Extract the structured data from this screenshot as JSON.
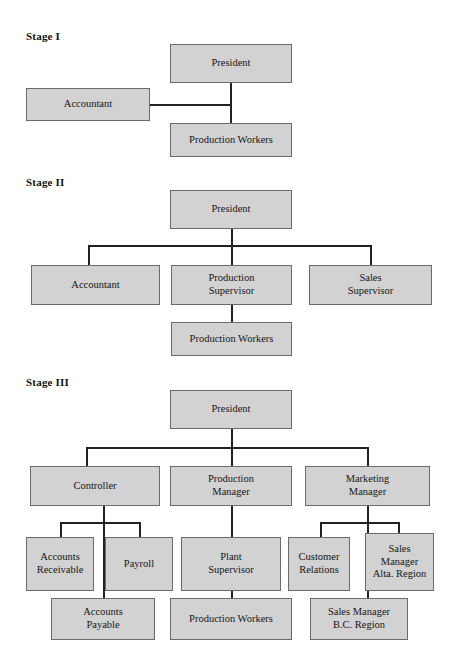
{
  "diagram": {
    "type": "organization-chart",
    "box_fill_color": "#d2d2d2",
    "box_border_color": "#6b6b6b",
    "connector_color": "#222222",
    "background_color": "#ffffff"
  },
  "stages": [
    {
      "id": "stage-1",
      "label": "Stage I",
      "nodes": [
        {
          "id": "s1-president",
          "label": "President",
          "level": 0
        },
        {
          "id": "s1-accountant",
          "label": "Accountant",
          "level": 1
        },
        {
          "id": "s1-production-workers",
          "label": "Production Workers",
          "level": 2
        }
      ],
      "edges": [
        {
          "from": "s1-president",
          "to": "s1-production-workers"
        },
        {
          "from": "s1-president",
          "to": "s1-accountant"
        }
      ]
    },
    {
      "id": "stage-2",
      "label": "Stage II",
      "nodes": [
        {
          "id": "s2-president",
          "label": "President",
          "level": 0
        },
        {
          "id": "s2-accountant",
          "label": "Accountant",
          "level": 1
        },
        {
          "id": "s2-production-supervisor",
          "label": "Production\nSupervisor",
          "line1": "Production",
          "line2": "Supervisor",
          "level": 1
        },
        {
          "id": "s2-sales-supervisor",
          "label": "Sales\nSupervisor",
          "line1": "Sales",
          "line2": "Supervisor",
          "level": 1
        },
        {
          "id": "s2-production-workers",
          "label": "Production Workers",
          "level": 2
        }
      ],
      "edges": [
        {
          "from": "s2-president",
          "to": "s2-accountant"
        },
        {
          "from": "s2-president",
          "to": "s2-production-supervisor"
        },
        {
          "from": "s2-president",
          "to": "s2-sales-supervisor"
        },
        {
          "from": "s2-production-supervisor",
          "to": "s2-production-workers"
        }
      ]
    },
    {
      "id": "stage-3",
      "label": "Stage III",
      "nodes": [
        {
          "id": "s3-president",
          "label": "President",
          "level": 0
        },
        {
          "id": "s3-controller",
          "label": "Controller",
          "level": 1
        },
        {
          "id": "s3-production-manager",
          "line1": "Production",
          "line2": "Manager",
          "level": 1
        },
        {
          "id": "s3-marketing-manager",
          "line1": "Marketing",
          "line2": "Manager",
          "level": 1
        },
        {
          "id": "s3-accounts-receivable",
          "line1": "Accounts",
          "line2": "Receivable",
          "level": 2
        },
        {
          "id": "s3-payroll",
          "label": "Payroll",
          "level": 2
        },
        {
          "id": "s3-plant-supervisor",
          "line1": "Plant",
          "line2": "Supervisor",
          "level": 2
        },
        {
          "id": "s3-customer-relations",
          "line1": "Customer",
          "line2": "Relations",
          "level": 2
        },
        {
          "id": "s3-sales-manager-alta",
          "line1": "Sales",
          "line2": "Manager",
          "line3": "Alta. Region",
          "level": 2
        },
        {
          "id": "s3-accounts-payable",
          "line1": "Accounts",
          "line2": "Payable",
          "level": 3
        },
        {
          "id": "s3-production-workers",
          "label": "Production Workers",
          "level": 3
        },
        {
          "id": "s3-sales-manager-bc",
          "line1": "Sales Manager",
          "line2": "B.C. Region",
          "level": 3
        }
      ],
      "edges": [
        {
          "from": "s3-president",
          "to": "s3-controller"
        },
        {
          "from": "s3-president",
          "to": "s3-production-manager"
        },
        {
          "from": "s3-president",
          "to": "s3-marketing-manager"
        },
        {
          "from": "s3-controller",
          "to": "s3-accounts-receivable"
        },
        {
          "from": "s3-controller",
          "to": "s3-payroll"
        },
        {
          "from": "s3-controller",
          "to": "s3-accounts-payable"
        },
        {
          "from": "s3-production-manager",
          "to": "s3-plant-supervisor"
        },
        {
          "from": "s3-plant-supervisor",
          "to": "s3-production-workers"
        },
        {
          "from": "s3-marketing-manager",
          "to": "s3-customer-relations"
        },
        {
          "from": "s3-marketing-manager",
          "to": "s3-sales-manager-alta"
        },
        {
          "from": "s3-marketing-manager",
          "to": "s3-sales-manager-bc"
        }
      ]
    }
  ],
  "labels": {
    "stage1": "Stage I",
    "stage2": "Stage II",
    "stage3": "Stage III",
    "president": "President",
    "accountant": "Accountant",
    "production_workers": "Production Workers",
    "production_line1": "Production",
    "supervisor_line2": "Supervisor",
    "sales_line1": "Sales",
    "controller": "Controller",
    "manager_line2": "Manager",
    "marketing_line1": "Marketing",
    "accounts_line1": "Accounts",
    "receivable_line2": "Receivable",
    "payable_line2": "Payable",
    "payroll": "Payroll",
    "plant_line1": "Plant",
    "customer_line1": "Customer",
    "relations_line2": "Relations",
    "alta_region_line3": "Alta. Region",
    "sales_manager_line1": "Sales Manager",
    "bc_region_line2": "B.C. Region"
  }
}
